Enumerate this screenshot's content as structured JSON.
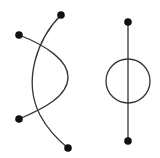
{
  "diagram": {
    "colors": {
      "stroke": "#333333",
      "dot": "#111111",
      "background": "#ffffff"
    },
    "left_figure": {
      "curves": [
        {
          "name": "curve-a",
          "endpoints": 2,
          "bulge": "left"
        },
        {
          "name": "curve-b",
          "endpoints": 2,
          "bulge": "right"
        }
      ],
      "dot_count": 4
    },
    "right_figure": {
      "elements": [
        "vertical-line",
        "circle"
      ],
      "dot_count": 2
    }
  }
}
